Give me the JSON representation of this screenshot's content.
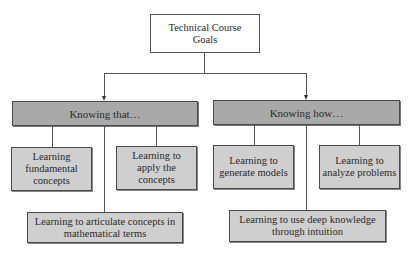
{
  "diagram": {
    "type": "hierarchy",
    "root": {
      "label": "Technical Course Goals"
    },
    "branches": [
      {
        "label": "Knowing that…",
        "children": [
          {
            "label": "Learning fundamental concepts"
          },
          {
            "label": "Learning to apply the concepts"
          },
          {
            "label": "Learning to articulate concepts in mathematical terms"
          }
        ]
      },
      {
        "label": "Knowing how…",
        "children": [
          {
            "label": "Learning to generate models"
          },
          {
            "label": "Learning to analyze problems"
          },
          {
            "label": "Learning to use deep knowledge through intuition"
          }
        ]
      }
    ],
    "colors": {
      "header_fill": "#a9a9a9",
      "leaf_fill": "#cfcfcf",
      "root_fill": "#ffffff",
      "line": "#555555"
    }
  }
}
